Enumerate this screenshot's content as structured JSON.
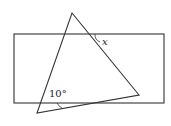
{
  "diagram": {
    "rectangle": {
      "x": 14,
      "y": 34,
      "width": 150,
      "height": 69
    },
    "triangle": {
      "points": [
        [
          72,
          13
        ],
        [
          139,
          95
        ],
        [
          37,
          113
        ]
      ]
    },
    "labels": {
      "angle_x": "x",
      "angle_10": "10°"
    },
    "stroke_color": "#333333"
  }
}
